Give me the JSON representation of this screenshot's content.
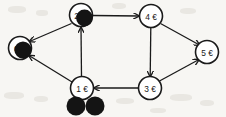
{
  "diagram": {
    "canvas": {
      "width": 226,
      "height": 117,
      "background": "#f7f6f3"
    },
    "ink_color": "#1a1a1a",
    "node_fill": "#ffffff",
    "token_color": "#141414",
    "nodes": [
      {
        "id": "n0",
        "label": "0",
        "cx": 20,
        "cy": 48,
        "r": 11.5,
        "tokens_on_node": 1
      },
      {
        "id": "n1",
        "label": "1 €",
        "cx": 82,
        "cy": 88,
        "r": 11.5,
        "tokens_on_node": 0
      },
      {
        "id": "n2",
        "label": "2 €",
        "cx": 81,
        "cy": 15,
        "r": 11.5,
        "tokens_on_node": 1
      },
      {
        "id": "n3",
        "label": "3 €",
        "cx": 150,
        "cy": 88,
        "r": 11.5,
        "tokens_on_node": 0
      },
      {
        "id": "n4",
        "label": "4 €",
        "cx": 151,
        "cy": 16,
        "r": 11.5,
        "tokens_on_node": 0
      },
      {
        "id": "n5",
        "label": "5 €",
        "cx": 207,
        "cy": 52,
        "r": 11.5,
        "tokens_on_node": 0
      }
    ],
    "loose_tokens": [
      {
        "id": "t1",
        "cx": 76,
        "cy": 106,
        "r": 9.5,
        "near_node": "n1"
      },
      {
        "id": "t2",
        "cx": 95,
        "cy": 106,
        "r": 9.5,
        "near_node": "n1"
      }
    ],
    "edges": [
      {
        "id": "e_2_0",
        "from": "n2",
        "to": "n0",
        "label": "",
        "directed": true
      },
      {
        "id": "e_1_0",
        "from": "n1",
        "to": "n0",
        "label": "",
        "directed": true
      },
      {
        "id": "e_1_2",
        "from": "n1",
        "to": "n2",
        "label": "",
        "directed": true
      },
      {
        "id": "e_2_4",
        "from": "n2",
        "to": "n4",
        "label": "",
        "directed": true
      },
      {
        "id": "e_4_3",
        "from": "n4",
        "to": "n3",
        "label": "",
        "directed": true
      },
      {
        "id": "e_4_5",
        "from": "n4",
        "to": "n5",
        "label": "",
        "directed": true
      },
      {
        "id": "e_3_5",
        "from": "n3",
        "to": "n5",
        "label": "",
        "directed": true
      },
      {
        "id": "e_3_1",
        "from": "n3",
        "to": "n1",
        "label": "",
        "directed": true
      }
    ]
  }
}
